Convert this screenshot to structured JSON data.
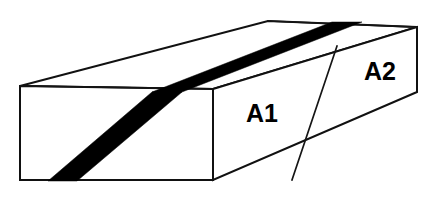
{
  "figure": {
    "kind": "3d-rectangular-block-diagram",
    "background_color": "#ffffff",
    "line_color": "#111111",
    "band_color": "#000000",
    "canvas": {
      "width": 431,
      "height": 201
    },
    "labels": [
      {
        "id": "A1",
        "text": "A1",
        "x": 262,
        "y": 115,
        "face": "front-right-face"
      },
      {
        "id": "A2",
        "text": "A2",
        "x": 380,
        "y": 73,
        "face": "front-right-face"
      }
    ],
    "geometry": {
      "front_left_face": "20,86 213,89 213,180 20,180",
      "top_face": "20,86 268,21 417,27 213,89",
      "front_right_face": "213,89 417,27 417,92 213,180",
      "divider_line": "337,46 292,180",
      "band_front": "48,181 77,181 182,92 152,92",
      "band_top": "152,92 182,92 362,22 332,22",
      "inner_top_edge": "20,86 213,89",
      "back_top_edge": "268,21 417,27"
    }
  }
}
